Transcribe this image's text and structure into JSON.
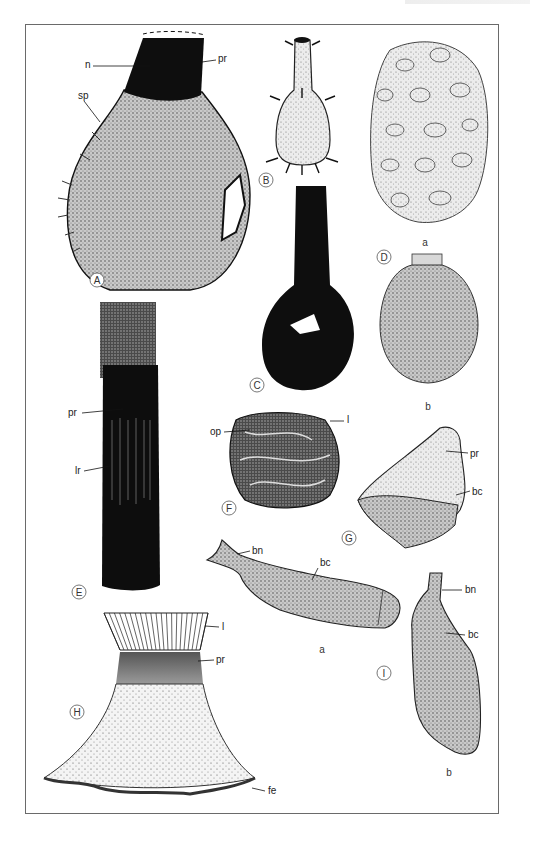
{
  "plate": {
    "figures": [
      {
        "id": "A",
        "labels": [
          "n",
          "pr",
          "sp"
        ]
      },
      {
        "id": "B",
        "labels": []
      },
      {
        "id": "C",
        "labels": []
      },
      {
        "id": "D",
        "labels": [],
        "parts": [
          "a",
          "b"
        ]
      },
      {
        "id": "E",
        "labels": [
          "pr",
          "lr"
        ]
      },
      {
        "id": "F",
        "labels": [
          "op",
          "l"
        ]
      },
      {
        "id": "G",
        "labels": [
          "pr",
          "bc"
        ]
      },
      {
        "id": "H",
        "labels": [
          "l",
          "pr",
          "fe"
        ]
      },
      {
        "id": "I",
        "labels": [
          "bn",
          "bc",
          "bn",
          "bc"
        ],
        "parts": [
          "a",
          "b"
        ]
      }
    ]
  },
  "A": {
    "marker": "A",
    "n": "n",
    "pr": "pr",
    "sp": "sp"
  },
  "B": {
    "marker": "B"
  },
  "C": {
    "marker": "C"
  },
  "D": {
    "marker": "D",
    "part_a": "a",
    "part_b": "b"
  },
  "E": {
    "marker": "E",
    "pr": "pr",
    "lr": "lr"
  },
  "F": {
    "marker": "F",
    "op": "op",
    "l": "l"
  },
  "G": {
    "marker": "G",
    "pr": "pr",
    "bc": "bc"
  },
  "H": {
    "marker": "H",
    "l": "l",
    "pr": "pr",
    "fe": "fe"
  },
  "I": {
    "marker": "I",
    "a_bn": "bn",
    "a_bc": "bc",
    "part_a": "a",
    "b_bn": "bn",
    "b_bc": "bc",
    "part_b": "b"
  },
  "colors": {
    "ink": "#111111",
    "stipple": "#8a8a8a",
    "frame": "#6a6a6a"
  }
}
